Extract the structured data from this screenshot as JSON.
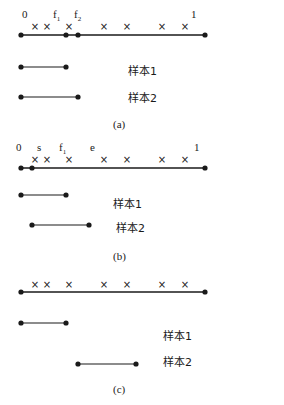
{
  "colors": {
    "ink": "#1a1a1a",
    "background": "#ffffff"
  },
  "panels": [
    {
      "id": "a",
      "caption": "(a)",
      "caption_pos": [
        113,
        128
      ],
      "main_line": {
        "y": 35,
        "x1": 21,
        "x2": 205,
        "dots": [
          21,
          66,
          78,
          205
        ]
      },
      "crosses": {
        "y": 30,
        "x": [
          35,
          47,
          69,
          104,
          127,
          162,
          185
        ]
      },
      "labels": [
        {
          "text": "0",
          "sub": "",
          "x": 22,
          "y": 18
        },
        {
          "text": "f",
          "sub": "1",
          "x": 53,
          "y": 18
        },
        {
          "text": "f",
          "sub": "2",
          "x": 74,
          "y": 18
        },
        {
          "text": "1",
          "sub": "",
          "x": 191,
          "y": 18
        }
      ],
      "samples": [
        {
          "label": "样本1",
          "x1": 21,
          "x2": 66,
          "y": 67,
          "label_x": 128,
          "label_y": 75
        },
        {
          "label": "样本2",
          "x1": 21,
          "x2": 78,
          "y": 97,
          "label_x": 128,
          "label_y": 102
        }
      ]
    },
    {
      "id": "b",
      "caption": "(b)",
      "caption_pos": [
        113,
        260
      ],
      "main_line": {
        "y": 168,
        "x1": 21,
        "x2": 205,
        "dots": [
          21,
          32,
          205
        ]
      },
      "crosses": {
        "y": 163,
        "x": [
          35,
          47,
          69,
          104,
          127,
          162,
          185
        ]
      },
      "labels": [
        {
          "text": "0",
          "sub": "",
          "x": 16,
          "y": 151
        },
        {
          "text": "s",
          "sub": "",
          "x": 37,
          "y": 151
        },
        {
          "text": "f",
          "sub": "1",
          "x": 59,
          "y": 151
        },
        {
          "text": "e",
          "sub": "",
          "x": 90,
          "y": 151
        },
        {
          "text": "1",
          "sub": "",
          "x": 194,
          "y": 151
        }
      ],
      "samples": [
        {
          "label": "样本1",
          "x1": 21,
          "x2": 66,
          "y": 195,
          "label_x": 113,
          "label_y": 208
        },
        {
          "label": "样本2",
          "x1": 32,
          "x2": 89,
          "y": 225,
          "label_x": 116,
          "label_y": 232
        }
      ]
    },
    {
      "id": "c",
      "caption": "(c)",
      "caption_pos": [
        113,
        393
      ],
      "main_line": {
        "y": 292,
        "x1": 21,
        "x2": 205,
        "dots": [
          21,
          205
        ]
      },
      "crosses": {
        "y": 288,
        "x": [
          35,
          47,
          69,
          104,
          127,
          162,
          185
        ]
      },
      "labels": [],
      "samples": [
        {
          "label": "样本1",
          "x1": 21,
          "x2": 66,
          "y": 323,
          "label_x": 163,
          "label_y": 340
        },
        {
          "label": "样本2",
          "x1": 78,
          "x2": 136,
          "y": 364,
          "label_x": 163,
          "label_y": 366
        }
      ]
    }
  ]
}
